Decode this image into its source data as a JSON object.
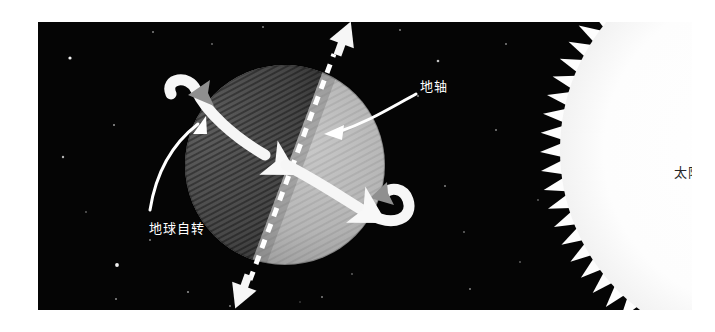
{
  "figure": {
    "title": "",
    "background_color": "#ffffff",
    "space_color": "#050505",
    "panel": {
      "x": 38,
      "y": 22,
      "width": 654,
      "height": 288
    }
  },
  "labels": {
    "axis": "地轴",
    "rotation": "地球自转",
    "sun": "太阳"
  },
  "colors": {
    "space": "#050505",
    "star": "#ffffff",
    "arrow_white": "#f6f6f6",
    "arrow_gray": "#8f8f8f",
    "earth_day": "#b9b9b9",
    "earth_night": "#4a4a4a",
    "sun_body": "#fdfdfd",
    "label_light": "#ffffff",
    "label_dark": "#242424"
  },
  "scene": {
    "earth": {
      "name": "earth-sphere",
      "cx": 285,
      "cy": 165,
      "r": 100,
      "day_side": "right",
      "night_side": "left",
      "axis_tilt_deg": 23.5
    },
    "axis_line": {
      "name": "earth-axis-dashed-line",
      "style": "dashed",
      "x1": 248,
      "y1": 276,
      "x2": 330,
      "y2": 56
    },
    "axis_arrow_north": {
      "name": "axis-arrow-north",
      "direction": "up-right"
    },
    "axis_arrow_south": {
      "name": "axis-arrow-south",
      "direction": "down-left"
    },
    "rotation_arrows": [
      {
        "name": "rotation-arrow-upper",
        "direction": "west-to-east",
        "position": "upper-left"
      },
      {
        "name": "rotation-arrow-lower",
        "direction": "west-to-east",
        "position": "lower-right"
      }
    ],
    "sun": {
      "name": "sun-disc",
      "cx": 760,
      "cy": 150,
      "r": 200,
      "ray_count": 72,
      "ray_length": 20
    },
    "stars": [
      {
        "x": 70,
        "y": 58
      },
      {
        "x": 63,
        "y": 157
      },
      {
        "x": 114,
        "y": 125
      },
      {
        "x": 117,
        "y": 265
      },
      {
        "x": 116,
        "y": 299
      },
      {
        "x": 153,
        "y": 21
      },
      {
        "x": 150,
        "y": 240
      },
      {
        "x": 188,
        "y": 292
      },
      {
        "x": 212,
        "y": 44
      },
      {
        "x": 230,
        "y": 306
      },
      {
        "x": 263,
        "y": 13
      },
      {
        "x": 322,
        "y": 297
      },
      {
        "x": 352,
        "y": 274
      },
      {
        "x": 400,
        "y": 19
      },
      {
        "x": 418,
        "y": 96
      },
      {
        "x": 438,
        "y": 61
      },
      {
        "x": 445,
        "y": 186
      },
      {
        "x": 464,
        "y": 232
      },
      {
        "x": 470,
        "y": 289
      },
      {
        "x": 496,
        "y": 130
      },
      {
        "x": 506,
        "y": 44
      },
      {
        "x": 520,
        "y": 262
      },
      {
        "x": 540,
        "y": 200
      },
      {
        "x": 172,
        "y": 83
      },
      {
        "x": 86,
        "y": 212
      },
      {
        "x": 300,
        "y": 320
      },
      {
        "x": 380,
        "y": 150
      }
    ]
  }
}
